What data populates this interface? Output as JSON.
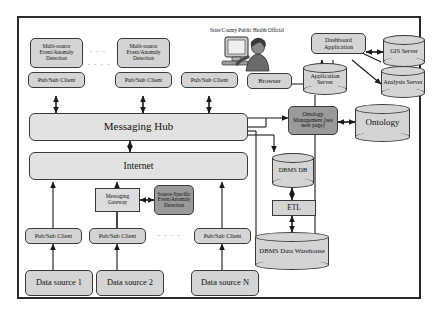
{
  "diagram": {
    "person_caption": "State/County Public Health Official",
    "ellipsis_upper": "· · ·",
    "ellipsis_lower": "· · · ·",
    "ellipsis_bottom": "· · · ·",
    "colors": {
      "node_fill": "#d4d4d4",
      "bar_fill": "#e2e2e2",
      "dark_fill": "#9a9a9a",
      "stroke": "#3a3a3a",
      "frame": "#2a2a2a",
      "background": "#ffffff"
    }
  },
  "nodes": {
    "msed1": "Multi-source Event/Anomaly Detection",
    "msed2": "Multi-source Event/Anomaly Detection",
    "pubsub_top1": "Pub/Sub Client",
    "pubsub_top2": "Pub/Sub Client",
    "pubsub_top3": "Pub/Sub Client",
    "browser": "Browser",
    "dashboard": "Dashboard Application",
    "gis_server": "GIS Server",
    "application_server": "Application Server",
    "analysis_server": "Analysis Server",
    "messaging_hub": "Messaging Hub",
    "ontology_management": "Ontology Management (see next page)",
    "ontology": "Ontology",
    "internet": "Internet",
    "dbms_db": "DBMS DB",
    "etl": "ETL",
    "dbms_warehouse": "DBMS Data Warehouse",
    "messaging_gateway": "Messaging Gateway",
    "source_specific": "Source-Specific Event/Anomaly Detection",
    "pubsub_bot1": "Pub/Sub Client",
    "pubsub_bot2": "Pub/Sub Client",
    "pubsub_bot3": "Pub/Sub Client",
    "data_source_1": "Data source 1",
    "data_source_2": "Data source 2",
    "data_source_n": "Data source N"
  }
}
